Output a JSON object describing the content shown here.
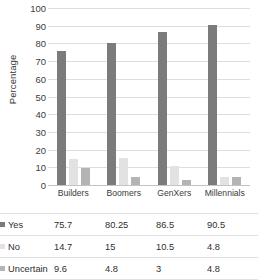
{
  "chart_data": {
    "type": "bar",
    "title": "",
    "xlabel": "",
    "ylabel": "Percentage",
    "ylim": [
      0,
      100
    ],
    "ytick_step": 10,
    "yticks": [
      100,
      90,
      80,
      70,
      60,
      50,
      40,
      30,
      20,
      10,
      0
    ],
    "grid": true,
    "legend_position": "data-table-below",
    "categories": [
      "Builders",
      "Boomers",
      "GenXers",
      "Millennials"
    ],
    "series": [
      {
        "name": "Yes",
        "color": "#7b7b7b",
        "values": [
          75.7,
          80.25,
          86.5,
          90.5
        ]
      },
      {
        "name": "No",
        "color": "#e2e2e2",
        "values": [
          14.7,
          15,
          10.5,
          4.8
        ]
      },
      {
        "name": "Uncertain",
        "color": "#b4b4b4",
        "values": [
          9.6,
          4.8,
          3,
          4.8
        ]
      }
    ],
    "data_table": {
      "rows": [
        {
          "label": "Yes",
          "swatch": "yes",
          "cells": [
            "75.7",
            "80.25",
            "86.5",
            "90.5"
          ]
        },
        {
          "label": "No",
          "swatch": "no",
          "cells": [
            "14.7",
            "15",
            "10.5",
            "4.8"
          ]
        },
        {
          "label": "Uncertain",
          "swatch": "uncertain",
          "cells": [
            "9.6",
            "4.8",
            "3",
            "4.8"
          ]
        }
      ]
    }
  }
}
